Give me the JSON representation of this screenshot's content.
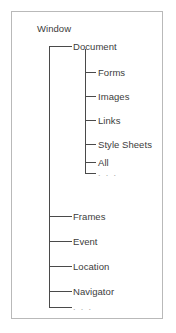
{
  "figure": {
    "type": "tree-diagram",
    "root": {
      "label": "Window"
    },
    "level1": [
      {
        "label": "Document"
      },
      {
        "label": "Frames"
      },
      {
        "label": "Event"
      },
      {
        "label": "Location"
      },
      {
        "label": "Navigator"
      },
      {
        "label": ". . ."
      }
    ],
    "level2": [
      {
        "label": "Forms"
      },
      {
        "label": "Images"
      },
      {
        "label": "Links"
      },
      {
        "label": "Style Sheets"
      },
      {
        "label": "All"
      },
      {
        "label": ". . ."
      }
    ],
    "colors": {
      "text": "#3c3c3c",
      "ellipsis_text": "#a9a9a9",
      "line": "#4a4a4a",
      "frame_border": "#b9b9b9",
      "background": "#ffffff"
    }
  }
}
